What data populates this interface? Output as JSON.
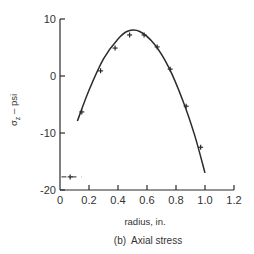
{
  "chart_data": {
    "type": "scatter",
    "title": "",
    "caption": "(b)  Axial stress",
    "xlabel": "radius, in.",
    "ylabel": "σz – psi",
    "ylabel_main": "σ",
    "ylabel_sub": "z",
    "ylabel_rest": " – psi",
    "xlim": [
      0,
      1.2
    ],
    "ylim": [
      -20,
      10
    ],
    "x_ticks": [
      0,
      0.2,
      0.4,
      0.6,
      0.8,
      1.0,
      1.2
    ],
    "x_tick_labels": [
      "0",
      "0.2",
      "0.4",
      "0.6",
      "0.8",
      "1.0",
      "1.2"
    ],
    "y_ticks": [
      -20,
      -10,
      0,
      10
    ],
    "y_tick_labels": [
      "-20",
      "-10",
      "0",
      "10"
    ],
    "grid": false,
    "legend": null,
    "series": [
      {
        "name": "measured",
        "marker": "+",
        "x": [
          0.07,
          0.15,
          0.28,
          0.38,
          0.48,
          0.58,
          0.67,
          0.76,
          0.87,
          0.97
        ],
        "y": [
          -17.7,
          -6.3,
          0.9,
          4.9,
          7.2,
          7.2,
          5.1,
          1.2,
          -5.3,
          -12.5
        ]
      },
      {
        "name": "theory",
        "style": "line",
        "x": [
          0.12,
          0.2,
          0.3,
          0.4,
          0.47,
          0.55,
          0.65,
          0.75,
          0.85,
          0.93,
          1.0
        ],
        "y": [
          -7.9,
          -2.5,
          3.0,
          6.5,
          7.9,
          7.8,
          5.6,
          1.5,
          -4.5,
          -10.5,
          -17.0
        ]
      }
    ],
    "annotations": [
      {
        "type": "dashed-hline",
        "y": -17.7,
        "x_from": 0.01,
        "x_to": 0.15
      }
    ]
  }
}
